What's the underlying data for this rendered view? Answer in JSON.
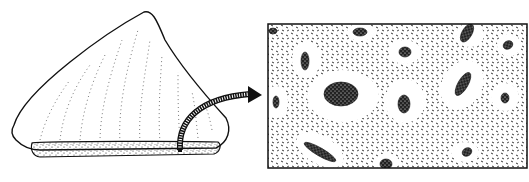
{
  "figure": {
    "panels": [
      {
        "name": "bone-fragment",
        "description": "gross specimen of bone fragment with cut surface stippled"
      },
      {
        "name": "histology-inset",
        "description": "magnified microscopic view of bone tissue with dark vascular canals"
      }
    ],
    "arrow": {
      "from": "bone-fragment",
      "to": "histology-inset"
    },
    "colors": {
      "ink": "#111111",
      "paper": "#ffffff"
    }
  }
}
